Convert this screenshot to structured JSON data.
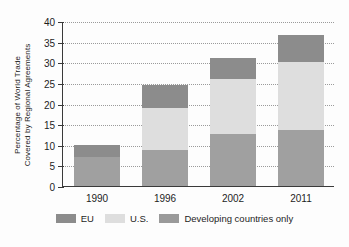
{
  "chart_data": {
    "type": "bar",
    "stacked": true,
    "title": "",
    "xlabel": "",
    "ylabel": "Percentage of World Trade\nCovered by Regional Agreements",
    "categories": [
      "1990",
      "1996",
      "2002",
      "2011"
    ],
    "ylim": [
      0,
      40
    ],
    "yticks": [
      0,
      5,
      10,
      15,
      20,
      25,
      30,
      35,
      40
    ],
    "grid": true,
    "legend_position": "bottom",
    "series": [
      {
        "name": "Developing countries only",
        "color": "#a0a0a0",
        "values": [
          7.1,
          8.7,
          12.5,
          13.5
        ]
      },
      {
        "name": "U.S.",
        "color": "#dedede",
        "values": [
          0.0,
          10.3,
          13.5,
          16.5
        ]
      },
      {
        "name": "EU",
        "color": "#8c8c8c",
        "values": [
          2.9,
          5.5,
          5.0,
          6.5
        ]
      }
    ],
    "totals": [
      10.0,
      24.5,
      31.0,
      36.5
    ]
  },
  "legend": {
    "items": [
      {
        "label": "EU",
        "swatch": "eu"
      },
      {
        "label": "U.S.",
        "swatch": "us"
      },
      {
        "label": "Developing countries only",
        "swatch": "dev"
      }
    ]
  }
}
